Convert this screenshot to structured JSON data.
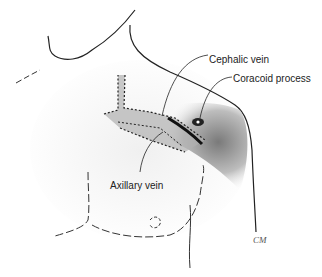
{
  "figure": {
    "type": "anatomical illustration",
    "labels": [
      {
        "id": "cephalic",
        "text": "Cephalic vein",
        "x": 209,
        "y": 54
      },
      {
        "id": "coracoid",
        "text": "Coracoid process",
        "x": 233,
        "y": 73
      },
      {
        "id": "axillary",
        "text": "Axillary vein",
        "x": 110,
        "y": 180
      }
    ],
    "signature": "CM"
  }
}
